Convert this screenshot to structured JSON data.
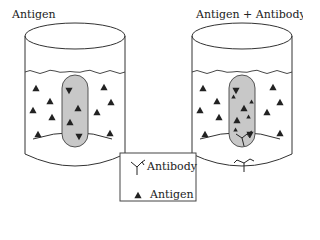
{
  "diagram": {
    "left_title": "Antigen",
    "right_title": "Antigen + Antibody",
    "legend": {
      "antibody_label": "Antibody",
      "antigen_label": "Antigen"
    },
    "colors": {
      "outline": "#333333",
      "gel_fill": "#c8c8c8",
      "marker": "#222222"
    }
  }
}
